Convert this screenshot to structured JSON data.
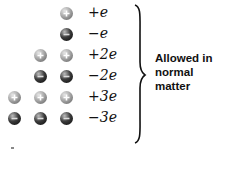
{
  "rows": [
    {
      "charge_label": "+e",
      "particles": [
        "pos"
      ]
    },
    {
      "charge_label": "−e",
      "particles": [
        "neg"
      ]
    },
    {
      "charge_label": "+2e",
      "particles": [
        "pos",
        "pos"
      ]
    },
    {
      "charge_label": "−2e",
      "particles": [
        "neg",
        "neg"
      ]
    },
    {
      "charge_label": "+3e",
      "particles": [
        "pos",
        "pos",
        "pos"
      ]
    },
    {
      "charge_label": "−3e",
      "particles": [
        "neg",
        "neg",
        "neg"
      ]
    }
  ],
  "annotation": {
    "line1": "Allowed in",
    "line2": "normal",
    "line3": "matter"
  },
  "colors": {
    "positive": "#a8a8a8",
    "negative": "#1a1a1a",
    "text": "#111111"
  }
}
